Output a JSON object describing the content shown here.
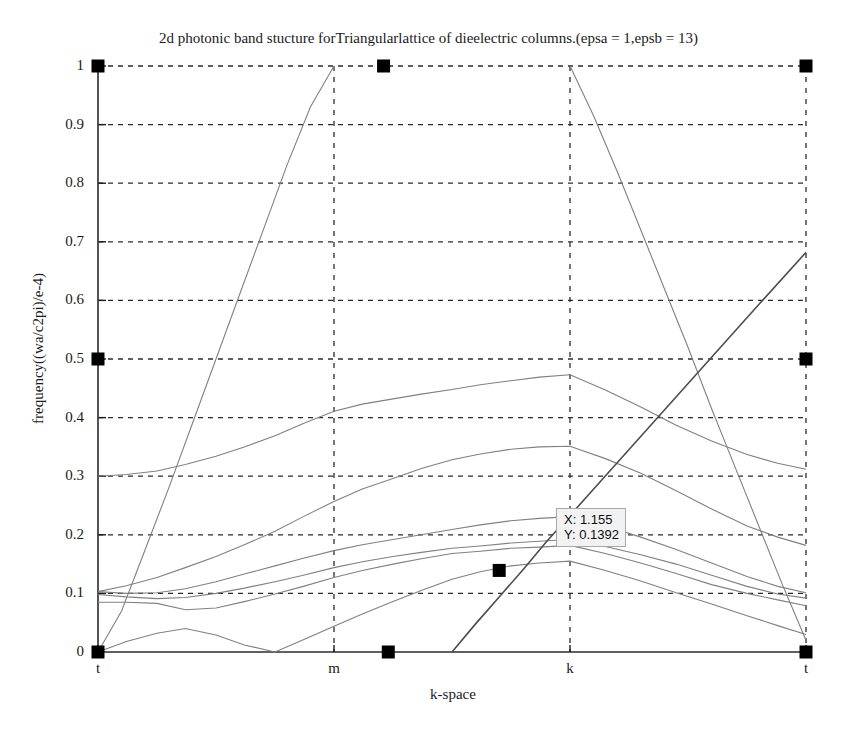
{
  "chart_data": {
    "type": "line",
    "title": "2d photonic band stucture forTriangularlattice of dieelectric columns.(epsa = 1,epsb = 13)",
    "xlabel": "k-space",
    "ylabel": "frequency((wa/c2pi)/e-4)",
    "xlim": [
      0,
      3
    ],
    "ylim": [
      0,
      1
    ],
    "grid": true,
    "legend_position": "none",
    "x_tick_values": [
      0,
      1,
      2,
      3
    ],
    "x_tick_labels": [
      "t",
      "m",
      "k",
      "t"
    ],
    "y_tick_values": [
      0,
      0.1,
      0.2,
      0.3,
      0.4,
      0.5,
      0.6,
      0.7,
      0.8,
      0.9,
      1
    ],
    "y_tick_labels": [
      "0",
      "0.1",
      "0.2",
      "0.3",
      "0.4",
      "0.5",
      "0.6",
      "0.7",
      "0.8",
      "0.9",
      "1"
    ],
    "line_color": "#808080",
    "marker_color": "#000000",
    "series": [
      {
        "name": "band-1",
        "x": [
          0,
          0.12,
          0.25,
          0.37,
          0.5,
          0.62,
          0.75,
          0.87,
          1.0,
          1.12,
          1.25,
          1.37,
          1.5,
          1.62,
          1.75,
          1.87,
          2.0,
          2.15,
          2.3,
          2.45,
          2.6,
          2.75,
          2.88,
          3.0
        ],
        "values": [
          0.0,
          0.018,
          0.032,
          0.04,
          0.029,
          0.012,
          0.0,
          0.021,
          0.044,
          0.065,
          0.086,
          0.105,
          0.124,
          0.137,
          0.147,
          0.152,
          0.155,
          0.139,
          0.121,
          0.101,
          0.082,
          0.062,
          0.045,
          0.03
        ]
      },
      {
        "name": "band-2",
        "x": [
          0,
          0.12,
          0.25,
          0.37,
          0.5,
          0.62,
          0.75,
          0.87,
          1.0,
          1.12,
          1.25,
          1.37,
          1.5,
          1.62,
          1.75,
          1.87,
          2.0,
          2.15,
          2.3,
          2.45,
          2.6,
          2.75,
          2.88,
          3.0
        ],
        "values": [
          0.085,
          0.085,
          0.083,
          0.072,
          0.075,
          0.086,
          0.099,
          0.112,
          0.127,
          0.139,
          0.15,
          0.159,
          0.168,
          0.172,
          0.177,
          0.179,
          0.182,
          0.168,
          0.152,
          0.134,
          0.115,
          0.1,
          0.089,
          0.079
        ]
      },
      {
        "name": "band-3",
        "x": [
          0,
          0.12,
          0.25,
          0.37,
          0.5,
          0.62,
          0.75,
          0.87,
          1.0,
          1.12,
          1.25,
          1.37,
          1.5,
          1.62,
          1.75,
          1.87,
          2.0,
          2.15,
          2.3,
          2.45,
          2.6,
          2.75,
          2.88,
          3.0
        ],
        "values": [
          0.098,
          0.094,
          0.091,
          0.093,
          0.1,
          0.109,
          0.12,
          0.131,
          0.144,
          0.154,
          0.163,
          0.17,
          0.177,
          0.181,
          0.186,
          0.189,
          0.192,
          0.18,
          0.166,
          0.15,
          0.131,
          0.112,
          0.099,
          0.092
        ]
      },
      {
        "name": "band-4",
        "x": [
          0,
          0.12,
          0.25,
          0.37,
          0.5,
          0.62,
          0.75,
          0.87,
          1.0,
          1.12,
          1.25,
          1.37,
          1.5,
          1.62,
          1.75,
          1.87,
          2.0,
          2.15,
          2.3,
          2.45,
          2.6,
          2.75,
          2.88,
          3.0
        ],
        "values": [
          0.103,
          0.1,
          0.101,
          0.108,
          0.12,
          0.133,
          0.147,
          0.16,
          0.173,
          0.183,
          0.192,
          0.2,
          0.209,
          0.217,
          0.224,
          0.228,
          0.231,
          0.215,
          0.196,
          0.175,
          0.152,
          0.129,
          0.112,
          0.101
        ]
      },
      {
        "name": "band-5",
        "x": [
          0,
          0.12,
          0.25,
          0.37,
          0.5,
          0.62,
          0.75,
          0.87,
          1.0,
          1.12,
          1.25,
          1.37,
          1.5,
          1.62,
          1.75,
          1.87,
          2.0,
          2.15,
          2.3,
          2.45,
          2.6,
          2.75,
          2.88,
          3.0
        ],
        "values": [
          0.103,
          0.113,
          0.127,
          0.144,
          0.163,
          0.183,
          0.206,
          0.231,
          0.257,
          0.278,
          0.296,
          0.313,
          0.328,
          0.338,
          0.346,
          0.35,
          0.351,
          0.33,
          0.305,
          0.275,
          0.244,
          0.215,
          0.196,
          0.182
        ]
      },
      {
        "name": "band-6",
        "x": [
          0,
          0.12,
          0.25,
          0.37,
          0.5,
          0.62,
          0.75,
          0.87,
          1.0,
          1.12,
          1.25,
          1.37,
          1.5,
          1.62,
          1.75,
          1.87,
          2.0,
          2.15,
          2.3,
          2.45,
          2.6,
          2.75,
          2.88,
          3.0
        ],
        "values": [
          0.3,
          0.303,
          0.309,
          0.32,
          0.334,
          0.35,
          0.369,
          0.39,
          0.411,
          0.423,
          0.432,
          0.44,
          0.448,
          0.456,
          0.463,
          0.469,
          0.473,
          0.447,
          0.418,
          0.387,
          0.36,
          0.337,
          0.322,
          0.312
        ]
      },
      {
        "name": "band-7-rising",
        "x": [
          0,
          0.1,
          0.2,
          0.3,
          0.4,
          0.5,
          0.6,
          0.7,
          0.8,
          0.9,
          1.0
        ],
        "values": [
          0.0,
          0.07,
          0.175,
          0.28,
          0.39,
          0.5,
          0.61,
          0.72,
          0.83,
          0.93,
          1.0
        ]
      },
      {
        "name": "band-8-falling",
        "x": [
          2.0,
          2.1,
          2.2,
          2.3,
          2.4,
          2.5,
          2.6,
          2.7,
          2.8,
          2.9,
          3.0
        ],
        "values": [
          1.0,
          0.915,
          0.82,
          0.72,
          0.62,
          0.52,
          0.415,
          0.315,
          0.215,
          0.115,
          0.02
        ]
      },
      {
        "name": "band-9-rising-right",
        "x": [
          1.5,
          1.6,
          1.7,
          1.8,
          1.9,
          2.0,
          2.2,
          2.4,
          2.6,
          2.8,
          3.0
        ],
        "values": [
          0.0,
          0.048,
          0.094,
          0.14,
          0.188,
          0.233,
          0.323,
          0.413,
          0.503,
          0.593,
          0.682
        ]
      }
    ],
    "markers": [
      {
        "name": "marker-top-left",
        "x": 0.0,
        "y": 1.0
      },
      {
        "name": "marker-top-mid",
        "x": 1.21,
        "y": 1.0
      },
      {
        "name": "marker-top-right",
        "x": 3.0,
        "y": 1.0
      },
      {
        "name": "marker-left-half",
        "x": 0.0,
        "y": 0.5
      },
      {
        "name": "marker-right-half",
        "x": 3.0,
        "y": 0.5
      },
      {
        "name": "marker-origin",
        "x": 0.0,
        "y": 0.0
      },
      {
        "name": "marker-axis-mid",
        "x": 1.23,
        "y": 0.0
      },
      {
        "name": "marker-bottom-right",
        "x": 3.0,
        "y": 0.0
      },
      {
        "name": "marker-datatip",
        "x": 1.7,
        "y": 0.1392
      }
    ],
    "datatip": {
      "x_line": "X: 1.155",
      "y_line": "Y: 0.1392",
      "x_value": 1.155,
      "y_value": 0.1392
    }
  }
}
